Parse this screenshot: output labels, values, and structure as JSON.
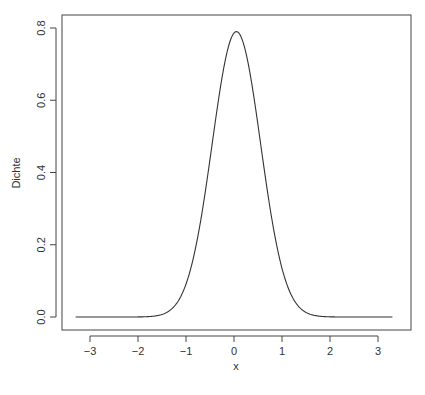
{
  "chart_data": {
    "type": "line",
    "title": "",
    "xlabel": "x",
    "ylabel": "Dichte",
    "xlim": [
      -3.35,
      3.35
    ],
    "ylim": [
      0,
      0.8
    ],
    "x_ticks": [
      -3,
      -2,
      -1,
      0,
      1,
      2,
      3
    ],
    "x_tick_labels": [
      "−3",
      "−2",
      "−1",
      "0",
      "1",
      "2",
      "3"
    ],
    "y_ticks": [
      0.0,
      0.2,
      0.4,
      0.6,
      0.8
    ],
    "y_tick_labels": [
      "0.0",
      "0.2",
      "0.4",
      "0.6",
      "0.8"
    ],
    "grid": false,
    "legend": null,
    "series": [
      {
        "name": "density",
        "description": "Normal density, mean ~0.05, sd ~0.5, peak ~0.79",
        "x": [
          -3.3,
          -2.5,
          -2.0,
          -1.75,
          -1.5,
          -1.25,
          -1.0,
          -0.75,
          -0.5,
          -0.25,
          0.0,
          0.05,
          0.25,
          0.5,
          0.75,
          1.0,
          1.25,
          1.5,
          1.75,
          2.0,
          2.5,
          3.3
        ],
        "y": [
          0.0,
          0.0,
          0.0,
          0.003,
          0.01,
          0.03,
          0.09,
          0.19,
          0.36,
          0.59,
          0.79,
          0.79,
          0.73,
          0.53,
          0.31,
          0.13,
          0.04,
          0.01,
          0.003,
          0.0,
          0.0,
          0.0
        ]
      }
    ]
  }
}
